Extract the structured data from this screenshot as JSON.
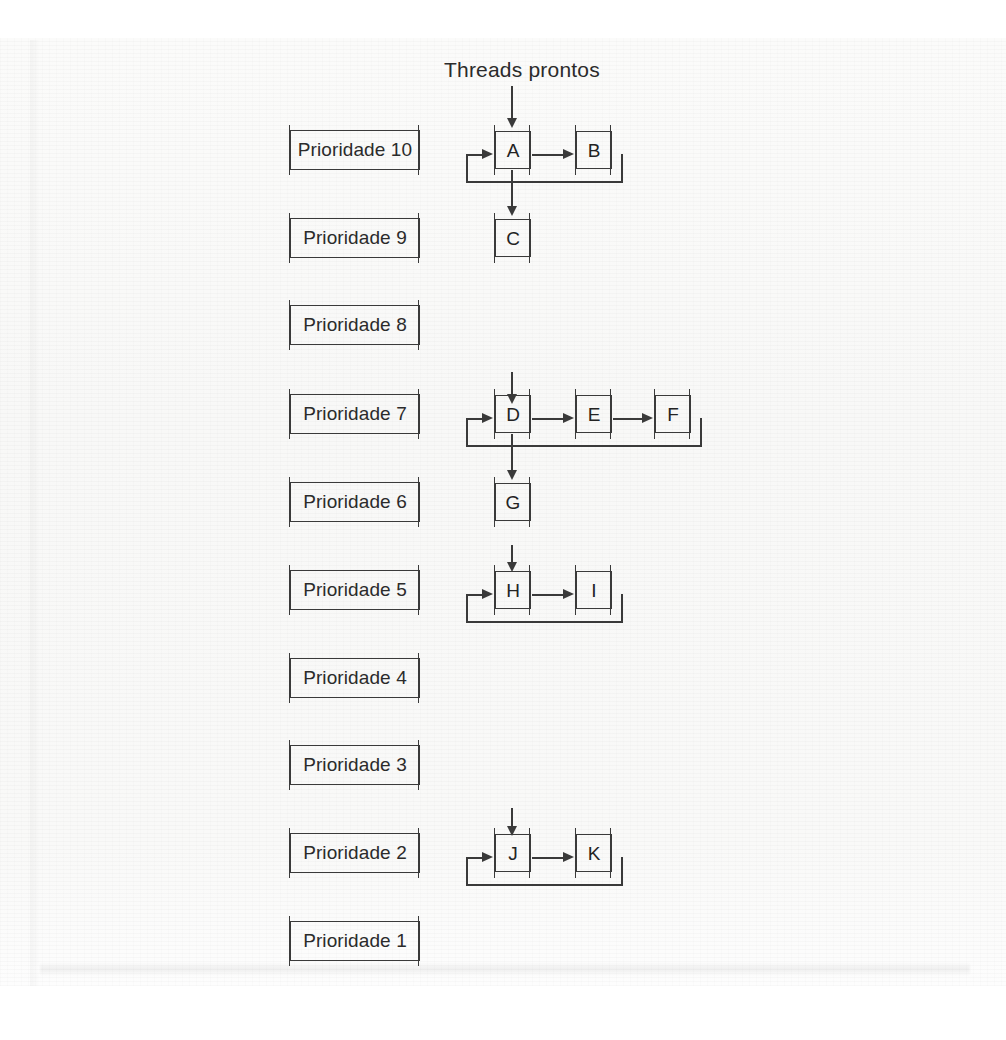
{
  "title": "Threads prontos",
  "priority_levels": [
    {
      "label": "Prioridade 10",
      "level": 10,
      "threads": [
        "A",
        "B"
      ],
      "has_queue": true
    },
    {
      "label": "Prioridade 9",
      "level": 9,
      "threads": [
        "C"
      ],
      "has_queue": false
    },
    {
      "label": "Prioridade 8",
      "level": 8,
      "threads": [],
      "has_queue": false
    },
    {
      "label": "Prioridade 7",
      "level": 7,
      "threads": [
        "D",
        "E",
        "F"
      ],
      "has_queue": true
    },
    {
      "label": "Prioridade 6",
      "level": 6,
      "threads": [
        "G"
      ],
      "has_queue": false
    },
    {
      "label": "Prioridade 5",
      "level": 5,
      "threads": [
        "H",
        "I"
      ],
      "has_queue": true
    },
    {
      "label": "Prioridade 4",
      "level": 4,
      "threads": [],
      "has_queue": false
    },
    {
      "label": "Prioridade 3",
      "level": 3,
      "threads": [],
      "has_queue": false
    },
    {
      "label": "Prioridade 2",
      "level": 2,
      "threads": [
        "J",
        "K"
      ],
      "has_queue": true
    },
    {
      "label": "Prioridade 1",
      "level": 1,
      "threads": [],
      "has_queue": false
    }
  ],
  "threads": {
    "A": "A",
    "B": "B",
    "C": "C",
    "D": "D",
    "E": "E",
    "F": "F",
    "G": "G",
    "H": "H",
    "I": "I",
    "J": "J",
    "K": "K"
  },
  "colors": {
    "ink": "#3a3a3a",
    "text": "#2b2b2b",
    "paper": "#f9f9f8"
  }
}
